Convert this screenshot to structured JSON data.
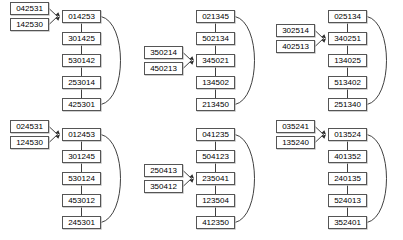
{
  "diagram": {
    "type": "permutation-cycle-graphs",
    "node_count_per_chain": 5,
    "input_count_per_group": 2,
    "colors": {
      "node_border": "#555555",
      "node_fill": "#ffffff",
      "edge": "#2a2a2a",
      "background": "#ffffff",
      "node_shadow": "#bbbbbb"
    },
    "groups": [
      {
        "id": "group-1",
        "position": {
          "left": 0,
          "top": 0
        },
        "inputs": [
          "042531",
          "142530"
        ],
        "chain": [
          "014253",
          "301425",
          "530142",
          "253014",
          "425301"
        ],
        "back_edge": {
          "from": "425301",
          "to": "014253"
        }
      },
      {
        "id": "group-2",
        "position": {
          "left": 134,
          "top": 0
        },
        "inputs": [
          "350214",
          "450213"
        ],
        "chain": [
          "021345",
          "502134",
          "345021",
          "134502",
          "213450"
        ],
        "input_target_index": 2,
        "back_edge": {
          "from": "213450",
          "to": "021345"
        }
      },
      {
        "id": "group-3",
        "position": {
          "left": 266,
          "top": 0
        },
        "inputs": [
          "302514",
          "402513"
        ],
        "chain": [
          "025134",
          "340251",
          "134025",
          "513402",
          "251340"
        ],
        "input_target_index": 1,
        "back_edge": {
          "from": "251340",
          "to": "025134"
        }
      },
      {
        "id": "group-4",
        "position": {
          "left": 0,
          "top": 118
        },
        "inputs": [
          "024531",
          "124530"
        ],
        "chain": [
          "012453",
          "301245",
          "530124",
          "453012",
          "245301"
        ],
        "back_edge": {
          "from": "245301",
          "to": "012453"
        }
      },
      {
        "id": "group-5",
        "position": {
          "left": 134,
          "top": 118
        },
        "inputs": [
          "250413",
          "350412"
        ],
        "chain": [
          "041235",
          "504123",
          "235041",
          "123504",
          "412350"
        ],
        "input_target_index": 2,
        "back_edge": {
          "from": "412350",
          "to": "041235"
        }
      },
      {
        "id": "group-6",
        "position": {
          "left": 266,
          "top": 118
        },
        "inputs": [
          "035241",
          "135240"
        ],
        "chain": [
          "013524",
          "401352",
          "240135",
          "524013",
          "352401"
        ],
        "back_edge": {
          "from": "352401",
          "to": "013524"
        }
      }
    ]
  }
}
